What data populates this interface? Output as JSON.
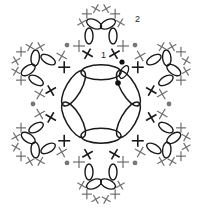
{
  "diagram": {
    "type": "crochet-chart",
    "labels": {
      "round1": "1",
      "round2": "2"
    },
    "center": [
      101,
      104
    ],
    "colors": {
      "round1": "#1a1a1a",
      "round2": "#6e6e6e",
      "dot_gray": "#777777",
      "start_dot": "#111111",
      "background": "#ffffff"
    },
    "petal_count": 6,
    "ring_chain_count": 6,
    "inner_sc_count": 12,
    "outer_sc_per_petal": 6
  }
}
